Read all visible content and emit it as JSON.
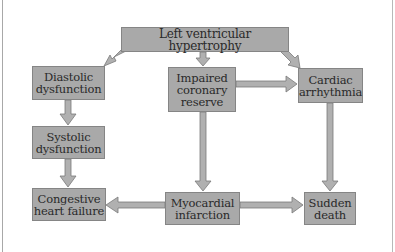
{
  "diagram": {
    "colors": {
      "box_fill": "#a9a9a9",
      "box_border": "#858585",
      "arrow_fill": "#b0b0b0",
      "arrow_stroke": "#7a7a7a",
      "text": "#2a2a2a",
      "background": "#ffffff"
    },
    "nodes": {
      "lvh": {
        "label": "Left ventricular hypertrophy"
      },
      "diastolic": {
        "line1": "Diastolic",
        "line2": "dysfunction"
      },
      "impaired": {
        "line1": "Impaired",
        "line2": "coronary",
        "line3": "reserve"
      },
      "arrhythmia": {
        "line1": "Cardiac",
        "line2": "arrhythmia"
      },
      "systolic": {
        "line1": "Systolic",
        "line2": "dysfunction"
      },
      "chf": {
        "line1": "Congestive",
        "line2": "heart failure"
      },
      "mi": {
        "line1": "Myocardial",
        "line2": "infarction"
      },
      "sudden": {
        "line1": "Sudden",
        "line2": "death"
      }
    },
    "edges": [
      {
        "from": "Left ventricular hypertrophy",
        "to": "Diastolic dysfunction"
      },
      {
        "from": "Left ventricular hypertrophy",
        "to": "Impaired coronary reserve"
      },
      {
        "from": "Left ventricular hypertrophy",
        "to": "Cardiac arrhythmia"
      },
      {
        "from": "Impaired coronary reserve",
        "to": "Cardiac arrhythmia"
      },
      {
        "from": "Diastolic dysfunction",
        "to": "Systolic dysfunction"
      },
      {
        "from": "Systolic dysfunction",
        "to": "Congestive heart failure"
      },
      {
        "from": "Impaired coronary reserve",
        "to": "Myocardial infarction"
      },
      {
        "from": "Cardiac arrhythmia",
        "to": "Sudden death"
      },
      {
        "from": "Myocardial infarction",
        "to": "Congestive heart failure"
      },
      {
        "from": "Myocardial infarction",
        "to": "Sudden death"
      }
    ]
  }
}
